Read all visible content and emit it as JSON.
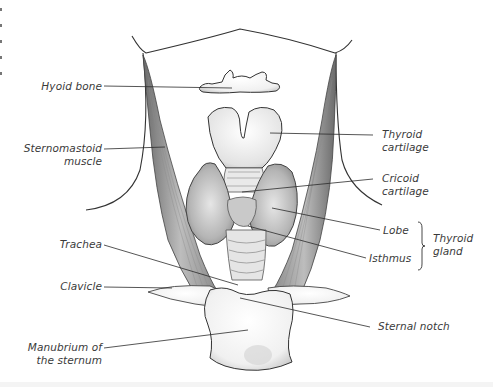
{
  "figure": {
    "colors": {
      "background": "#ffffff",
      "ink": "#2b2b2b",
      "label_text": "#3a3a3a",
      "shading": "#9a9a9a"
    }
  },
  "labels": {
    "hyoid_bone": "Hyoid bone",
    "sternomastoid_muscle": [
      "Sternomastoid",
      "muscle"
    ],
    "thyroid_cartilage": [
      "Thyroid",
      "cartilage"
    ],
    "cricoid_cartilage": [
      "Cricoid",
      "cartilage"
    ],
    "lobe": "Lobe",
    "isthmus": "Isthmus",
    "thyroid_gland": [
      "Thyroid",
      "gland"
    ],
    "trachea": "Trachea",
    "clavicle": "Clavicle",
    "sternal_notch": "Sternal notch",
    "manubrium": [
      "Manubrium of",
      "the sternum"
    ]
  }
}
